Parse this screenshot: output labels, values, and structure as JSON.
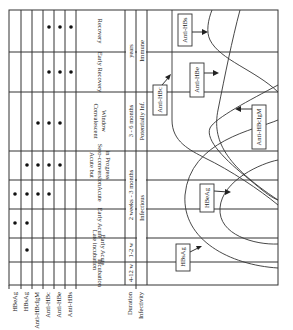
{
  "figure": {
    "orientation": "rotated 90deg clockwise (read with page turned)"
  },
  "markers": [
    "HBeAg",
    "HBsAg",
    "Anti-HBcIgM",
    "Anti-HBc",
    "Anti-HBe",
    "Anti-HBs"
  ],
  "row_headers": {
    "duration": "Duration",
    "infectivity": "Infectivity"
  },
  "phases": [
    {
      "name": "Incubation",
      "duration": "4-12 w",
      "markers_present": []
    },
    {
      "name": "Late incubation Early Acute",
      "duration": "1-2 w",
      "markers_present": [
        "HBsAg"
      ]
    },
    {
      "name": "Early Acute",
      "duration": "",
      "markers_present": [
        "HBeAg",
        "HBsAg"
      ]
    },
    {
      "name": "Acute",
      "duration": "",
      "markers_present": [
        "HBeAg",
        "HBsAg",
        "Anti-HBcIgM",
        "Anti-HBc"
      ]
    },
    {
      "name": "Acute but Sero-conversion in Progress",
      "duration": "",
      "markers_present": [
        "HBsAg",
        "Anti-HBcIgM",
        "Anti-HBc",
        "Anti-HBe"
      ]
    },
    {
      "name": "Convalescent Window",
      "duration": "",
      "markers_present": [
        "Anti-HBcIgM",
        "Anti-HBc",
        "Anti-HBe"
      ]
    },
    {
      "name": "Early Recovery",
      "duration": "",
      "markers_present": [
        "Anti-HBc",
        "Anti-HBe",
        "Anti-HBs"
      ]
    },
    {
      "name": "Recovery",
      "duration": "",
      "markers_present": [
        "Anti-HBc",
        "Anti-HBe",
        "Anti-HBs"
      ]
    }
  ],
  "duration_spans": [
    {
      "label": "4-12 w",
      "from_phase": 0,
      "to_phase": 0
    },
    {
      "label": "1-2 w",
      "from_phase": 1,
      "to_phase": 1
    },
    {
      "label": "2 weeks - 3 months",
      "from_phase": 2,
      "to_phase": 4
    },
    {
      "label": "3 - 6 months",
      "from_phase": 5,
      "to_phase": 5
    },
    {
      "label": "years",
      "from_phase": 6,
      "to_phase": 7
    }
  ],
  "infectivity_spans": [
    {
      "label": "",
      "from_phase": 0,
      "to_phase": 0
    },
    {
      "label": "",
      "from_phase": 1,
      "to_phase": 1
    },
    {
      "label": "Infectious",
      "from_phase": 2,
      "to_phase": 4
    },
    {
      "label": "Potentially Inf.",
      "from_phase": 5,
      "to_phase": 5
    },
    {
      "label": "Immune",
      "from_phase": 6,
      "to_phase": 7
    }
  ],
  "curve_labels": {
    "hbsag": "HBsAg",
    "hbeag": "HBeAg",
    "anti_hbc": "Anti-HBc",
    "anti_hbe": "Anti-HBe",
    "anti_hbcigm": "Anti-HBcIgM",
    "anti_hbs": "Anti-HBs"
  },
  "colors": {
    "line": "#333333",
    "dot": "#111111",
    "background": "#ffffff"
  }
}
